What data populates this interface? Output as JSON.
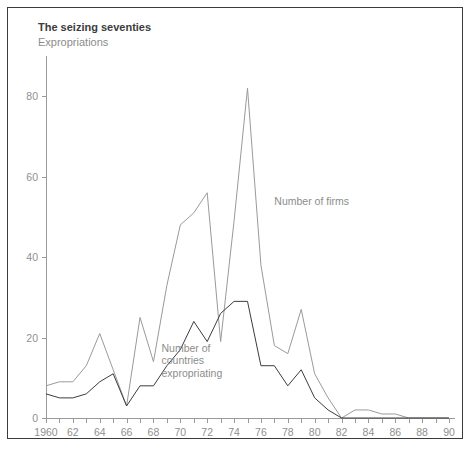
{
  "chart_data": {
    "type": "line",
    "title": "The seizing seventies",
    "subtitle": "Expropriations",
    "xlabel": "",
    "ylabel": "",
    "xlim": [
      1960,
      1990
    ],
    "ylim": [
      0,
      90
    ],
    "yticks": [
      0,
      20,
      40,
      60,
      80
    ],
    "ytick_labels": [
      "0",
      "20",
      "40",
      "60",
      "80"
    ],
    "xticks": [
      1960,
      1961,
      1962,
      1963,
      1964,
      1965,
      1966,
      1967,
      1968,
      1969,
      1970,
      1971,
      1972,
      1973,
      1974,
      1975,
      1976,
      1977,
      1978,
      1979,
      1980,
      1981,
      1982,
      1983,
      1984,
      1985,
      1986,
      1987,
      1988,
      1989,
      1990
    ],
    "xtick_labels": [
      "1960",
      "62",
      "64",
      "66",
      "68",
      "70",
      "72",
      "74",
      "76",
      "78",
      "80",
      "82",
      "84",
      "86",
      "88",
      "90"
    ],
    "xtick_label_years": [
      1960,
      1962,
      1964,
      1966,
      1968,
      1970,
      1972,
      1974,
      1976,
      1978,
      1980,
      1982,
      1984,
      1986,
      1988,
      1990
    ],
    "grid": false,
    "legend_position": "inline-annotations",
    "x": [
      1960,
      1961,
      1962,
      1963,
      1964,
      1965,
      1966,
      1967,
      1968,
      1969,
      1970,
      1971,
      1972,
      1973,
      1974,
      1975,
      1976,
      1977,
      1978,
      1979,
      1980,
      1981,
      1982,
      1983,
      1984,
      1985,
      1986,
      1987,
      1988,
      1989,
      1990
    ],
    "series": [
      {
        "name": "Number of firms",
        "color": "#9a9a9a",
        "label_x": 1977,
        "label_y": 53,
        "values": [
          8,
          9,
          9,
          13,
          21,
          12,
          3,
          25,
          14,
          33,
          48,
          51,
          56,
          19,
          49,
          82,
          38,
          18,
          16,
          27,
          11,
          5,
          0,
          2,
          2,
          1,
          1,
          0,
          0,
          0,
          0
        ]
      },
      {
        "name": "Number of countries expropriating",
        "color": "#3c3c3c",
        "label_x": 1968.6,
        "label_y": 16.5,
        "values": [
          6,
          5,
          5,
          6,
          9,
          11,
          3,
          8,
          8,
          13,
          17,
          24,
          19,
          26,
          29,
          29,
          13,
          13,
          8,
          12,
          5,
          2,
          0,
          0,
          0,
          0,
          0,
          0,
          0,
          0,
          0
        ]
      }
    ],
    "annotations": [
      {
        "text": "Number of firms",
        "lines": [
          "Number of firms"
        ]
      },
      {
        "text": "Number of countries expropriating",
        "lines": [
          "Number of",
          "countries",
          "expropriating"
        ]
      }
    ]
  }
}
